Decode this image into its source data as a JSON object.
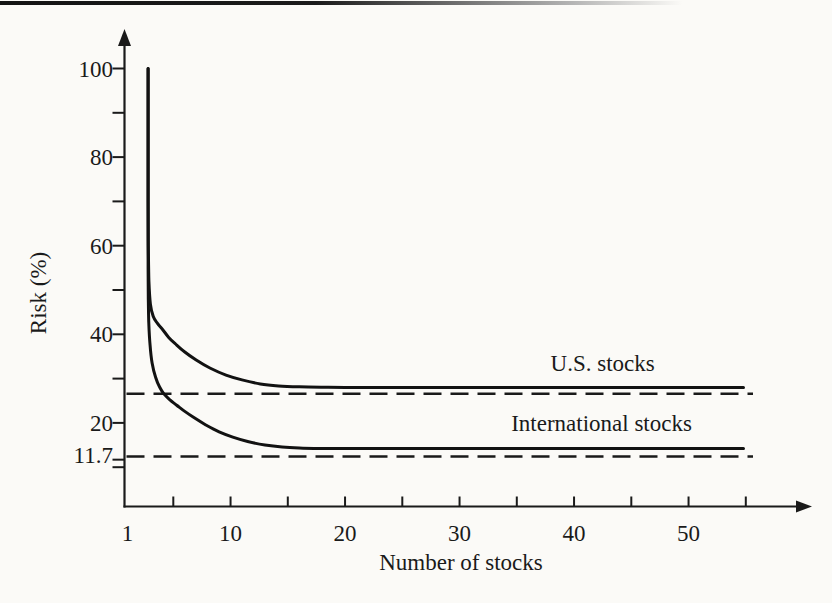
{
  "page": {
    "background_color": "#fbfaf7",
    "ink_color": "#1a1a1a",
    "top_rule": "horizontal page rule fading to the right"
  },
  "chart_data": {
    "type": "line",
    "title": "",
    "xlabel": "Number of stocks",
    "ylabel": "Risk (%)",
    "xlim": [
      1,
      58
    ],
    "ylim": [
      1,
      108
    ],
    "grid": false,
    "legend": "inline-annotations",
    "xaxis": {
      "minor_ticks": [
        5,
        10,
        15,
        20,
        25,
        30,
        35,
        40,
        45,
        50,
        55
      ],
      "labeled_ticks": [
        [
          1,
          "1"
        ],
        [
          10,
          "10"
        ],
        [
          20,
          "20"
        ],
        [
          30,
          "30"
        ],
        [
          40,
          "40"
        ],
        [
          50,
          "50"
        ]
      ]
    },
    "yaxis": {
      "minor_ticks": [
        10,
        20,
        30,
        40,
        50,
        60,
        70,
        80,
        90,
        100
      ],
      "labeled_ticks": [
        [
          100,
          "100"
        ],
        [
          80,
          "80"
        ],
        [
          60,
          "60"
        ],
        [
          40,
          "40"
        ],
        [
          20,
          "20"
        ],
        [
          11.7,
          "11.7"
        ]
      ]
    },
    "series": [
      {
        "name": "U.S. stocks",
        "asymptote": 28,
        "points": [
          [
            2.8,
            100
          ],
          [
            2.8,
            85
          ],
          [
            2.8,
            70
          ],
          [
            2.82,
            60
          ],
          [
            2.87,
            52
          ],
          [
            3.0,
            46.8
          ],
          [
            3.25,
            44
          ],
          [
            3.6,
            42.5
          ],
          [
            4.0,
            41.3
          ],
          [
            4.6,
            39.3
          ],
          [
            5.2,
            37.8
          ],
          [
            6.0,
            36.0
          ],
          [
            7.0,
            34.2
          ],
          [
            8.2,
            32.4
          ],
          [
            9.6,
            30.8
          ],
          [
            11,
            29.7
          ],
          [
            12.6,
            28.8
          ],
          [
            14.2,
            28.35
          ],
          [
            16,
            28.15
          ],
          [
            18,
            28.05
          ],
          [
            20,
            28
          ],
          [
            26,
            28
          ],
          [
            34,
            28
          ],
          [
            44,
            28
          ],
          [
            54.8,
            28
          ]
        ]
      },
      {
        "name": "International stocks",
        "asymptote": 14.2,
        "points": [
          [
            2.8,
            100
          ],
          [
            2.8,
            82
          ],
          [
            2.8,
            65
          ],
          [
            2.8,
            55
          ],
          [
            2.82,
            48
          ],
          [
            2.86,
            42.5
          ],
          [
            2.97,
            37.5
          ],
          [
            3.15,
            33.5
          ],
          [
            3.45,
            30.3
          ],
          [
            3.8,
            28.1
          ],
          [
            4.2,
            26.5
          ],
          [
            4.7,
            25.2
          ],
          [
            5.3,
            24.0
          ],
          [
            6.0,
            22.6
          ],
          [
            6.8,
            21.2
          ],
          [
            7.8,
            19.6
          ],
          [
            9.0,
            18.0
          ],
          [
            10.2,
            16.8
          ],
          [
            11.5,
            15.8
          ],
          [
            13.0,
            15.0
          ],
          [
            14.5,
            14.55
          ],
          [
            16.0,
            14.35
          ],
          [
            18,
            14.25
          ],
          [
            20,
            14.2
          ],
          [
            26,
            14.2
          ],
          [
            34,
            14.2
          ],
          [
            44,
            14.2
          ],
          [
            54.8,
            14.2
          ]
        ]
      }
    ],
    "reference_lines": [
      {
        "value": 27,
        "style": "dashed",
        "label": ""
      },
      {
        "value": 11.7,
        "style": "dashed",
        "label": "11.7"
      }
    ],
    "annotations": [
      {
        "text": "U.S. stocks",
        "x": 42.5,
        "y": 31.7
      },
      {
        "text": "International stocks",
        "x": 42.4,
        "y": 18.2
      }
    ]
  }
}
